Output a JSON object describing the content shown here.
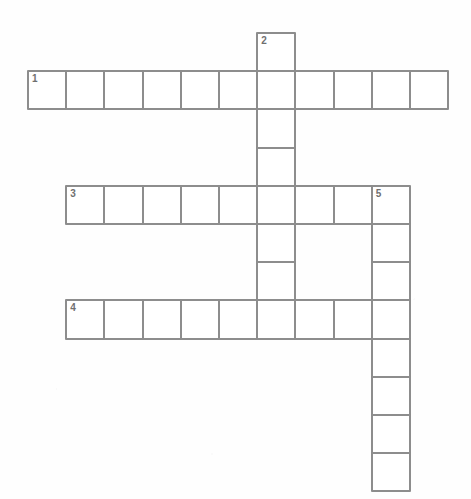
{
  "puzzle": {
    "title": "Crossword Puzzle Grid",
    "kind": "crossword-grid",
    "cell_size": 38.2,
    "origin_x": 27,
    "origin_y": 32,
    "colors": {
      "cell_fill": "#ffffff",
      "cell_border": "#8d8d8d",
      "number_text": "#6f6f6f",
      "page_background": "#fefefe"
    },
    "entries": [
      {
        "number": "1",
        "direction": "across",
        "row": 1,
        "col": 0,
        "length": 11,
        "answer_cells": [
          "",
          "",
          "",
          "",
          "",
          "",
          "",
          "",
          "",
          "",
          ""
        ]
      },
      {
        "number": "2",
        "direction": "down",
        "row": 0,
        "col": 6,
        "length": 8,
        "answer_cells": [
          "",
          "",
          "",
          "",
          "",
          "",
          "",
          ""
        ]
      },
      {
        "number": "3",
        "direction": "across",
        "row": 4,
        "col": 1,
        "length": 9,
        "answer_cells": [
          "",
          "",
          "",
          "",
          "",
          "",
          "",
          "",
          ""
        ]
      },
      {
        "number": "4",
        "direction": "across",
        "row": 7,
        "col": 1,
        "length": 9,
        "answer_cells": [
          "",
          "",
          "",
          "",
          "",
          "",
          "",
          "",
          ""
        ]
      },
      {
        "number": "5",
        "direction": "down",
        "row": 4,
        "col": 9,
        "length": 8,
        "answer_cells": [
          "",
          "",
          "",
          "",
          "",
          "",
          "",
          ""
        ]
      }
    ],
    "numbered_cells": [
      {
        "label": "1",
        "row": 1,
        "col": 0
      },
      {
        "label": "2",
        "row": 0,
        "col": 6
      },
      {
        "label": "3",
        "row": 4,
        "col": 1
      },
      {
        "label": "4",
        "row": 7,
        "col": 1
      },
      {
        "label": "5",
        "row": 4,
        "col": 9
      }
    ]
  }
}
